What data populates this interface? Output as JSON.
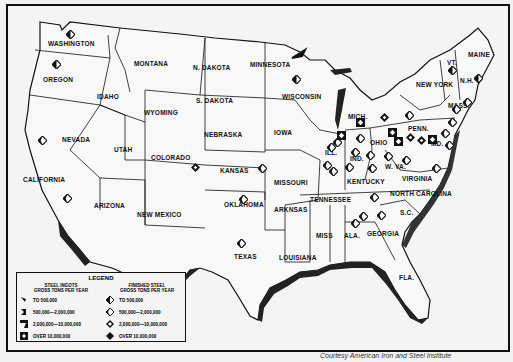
{
  "map": {
    "type": "US steel production map",
    "states": [
      {
        "name": "WASHINGTON",
        "x": 68,
        "y": 44
      },
      {
        "name": "OREGON",
        "x": 55,
        "y": 80
      },
      {
        "name": "MONTANA",
        "x": 148,
        "y": 64
      },
      {
        "name": "IDAHO",
        "x": 107,
        "y": 97
      },
      {
        "name": "WYOMING",
        "x": 158,
        "y": 113
      },
      {
        "name": "N. DAKOTA",
        "x": 211,
        "y": 68
      },
      {
        "name": "S. DAKOTA",
        "x": 214,
        "y": 101
      },
      {
        "name": "MINNESOTA",
        "x": 268,
        "y": 65
      },
      {
        "name": "WISCONSIN",
        "x": 300,
        "y": 97
      },
      {
        "name": "MICH.",
        "x": 358,
        "y": 117
      },
      {
        "name": "NEW YORK",
        "x": 432,
        "y": 85
      },
      {
        "name": "VT.",
        "x": 453,
        "y": 63
      },
      {
        "name": "N.H.",
        "x": 468,
        "y": 81
      },
      {
        "name": "MAINE",
        "x": 478,
        "y": 55
      },
      {
        "name": "MASS.",
        "x": 458,
        "y": 106
      },
      {
        "name": "PENN.",
        "x": 418,
        "y": 129
      },
      {
        "name": "MD.",
        "x": 437,
        "y": 144
      },
      {
        "name": "NEVADA",
        "x": 74,
        "y": 140
      },
      {
        "name": "UTAH",
        "x": 122,
        "y": 150
      },
      {
        "name": "COLORADO",
        "x": 167,
        "y": 158
      },
      {
        "name": "NEBRASKA",
        "x": 220,
        "y": 135
      },
      {
        "name": "IOWA",
        "x": 282,
        "y": 133
      },
      {
        "name": "ILL.",
        "x": 333,
        "y": 153
      },
      {
        "name": "IND.",
        "x": 358,
        "y": 159
      },
      {
        "name": "OHIO",
        "x": 378,
        "y": 143
      },
      {
        "name": "W. VA.",
        "x": 397,
        "y": 167
      },
      {
        "name": "CALIFORNIA",
        "x": 43,
        "y": 180
      },
      {
        "name": "KANSAS",
        "x": 232,
        "y": 171
      },
      {
        "name": "MISSOURI",
        "x": 290,
        "y": 183
      },
      {
        "name": "KENTUCKY",
        "x": 363,
        "y": 182
      },
      {
        "name": "VIRGINIA",
        "x": 418,
        "y": 179
      },
      {
        "name": "NORTH CAROLINA",
        "x": 418,
        "y": 194
      },
      {
        "name": "ARIZONA",
        "x": 108,
        "y": 206
      },
      {
        "name": "NEW MEXICO",
        "x": 157,
        "y": 215
      },
      {
        "name": "OKLAHOMA",
        "x": 240,
        "y": 205
      },
      {
        "name": "ARKNSAS",
        "x": 288,
        "y": 210
      },
      {
        "name": "TENNESSEE",
        "x": 328,
        "y": 200
      },
      {
        "name": "S.C.",
        "x": 408,
        "y": 213
      },
      {
        "name": "TEXAS",
        "x": 244,
        "y": 257
      },
      {
        "name": "LOUISIANA",
        "x": 297,
        "y": 258
      },
      {
        "name": "MISS",
        "x": 324,
        "y": 236
      },
      {
        "name": "ALA.",
        "x": 352,
        "y": 236
      },
      {
        "name": "GEORGIA",
        "x": 381,
        "y": 234
      },
      {
        "name": "FLA.",
        "x": 407,
        "y": 278
      }
    ],
    "symbols": [
      {
        "x": 70,
        "y": 34,
        "kind": "finished",
        "size": 1
      },
      {
        "x": 56,
        "y": 64,
        "kind": "finished",
        "size": 1
      },
      {
        "x": 42,
        "y": 140,
        "kind": "finished",
        "size": 2
      },
      {
        "x": 67,
        "y": 198,
        "kind": "finished",
        "size": 2
      },
      {
        "x": 195,
        "y": 167,
        "kind": "finished",
        "size": 3
      },
      {
        "x": 262,
        "y": 168,
        "kind": "finished",
        "size": 2
      },
      {
        "x": 241,
        "y": 243,
        "kind": "finished",
        "size": 2
      },
      {
        "x": 243,
        "y": 199,
        "kind": "finished",
        "size": 2
      },
      {
        "x": 296,
        "y": 79,
        "kind": "finished",
        "size": 1
      },
      {
        "x": 331,
        "y": 147,
        "kind": "finished",
        "size": 2
      },
      {
        "x": 337,
        "y": 142,
        "kind": "finished",
        "size": 2
      },
      {
        "x": 333,
        "y": 171,
        "kind": "finished",
        "size": 2
      },
      {
        "x": 327,
        "y": 165,
        "kind": "finished",
        "size": 2
      },
      {
        "x": 360,
        "y": 138,
        "kind": "finished",
        "size": 2
      },
      {
        "x": 355,
        "y": 152,
        "kind": "finished",
        "size": 2
      },
      {
        "x": 349,
        "y": 167,
        "kind": "finished",
        "size": 2
      },
      {
        "x": 370,
        "y": 155,
        "kind": "finished",
        "size": 2
      },
      {
        "x": 372,
        "y": 168,
        "kind": "finished",
        "size": 2
      },
      {
        "x": 388,
        "y": 156,
        "kind": "finished",
        "size": 2
      },
      {
        "x": 406,
        "y": 160,
        "kind": "finished",
        "size": 2
      },
      {
        "x": 409,
        "y": 115,
        "kind": "finished",
        "size": 2
      },
      {
        "x": 384,
        "y": 117,
        "kind": "finished",
        "size": 3
      },
      {
        "x": 392,
        "y": 132,
        "kind": "ingot",
        "size": 3
      },
      {
        "x": 398,
        "y": 141,
        "kind": "ingot",
        "size": 3
      },
      {
        "x": 410,
        "y": 137,
        "kind": "finished",
        "size": 3
      },
      {
        "x": 421,
        "y": 140,
        "kind": "finished",
        "size": 3
      },
      {
        "x": 432,
        "y": 139,
        "kind": "ingot",
        "size": 3
      },
      {
        "x": 445,
        "y": 133,
        "kind": "finished",
        "size": 2
      },
      {
        "x": 449,
        "y": 145,
        "kind": "finished",
        "size": 2
      },
      {
        "x": 452,
        "y": 122,
        "kind": "finished",
        "size": 2
      },
      {
        "x": 436,
        "y": 168,
        "kind": "finished",
        "size": 2
      },
      {
        "x": 452,
        "y": 70,
        "kind": "finished",
        "size": 1
      },
      {
        "x": 478,
        "y": 78,
        "kind": "finished",
        "size": 1
      },
      {
        "x": 467,
        "y": 102,
        "kind": "finished",
        "size": 2
      },
      {
        "x": 456,
        "y": 109,
        "kind": "finished",
        "size": 2
      },
      {
        "x": 374,
        "y": 197,
        "kind": "finished",
        "size": 2
      },
      {
        "x": 363,
        "y": 216,
        "kind": "finished",
        "size": 2
      },
      {
        "x": 355,
        "y": 223,
        "kind": "finished",
        "size": 2
      },
      {
        "x": 381,
        "y": 215,
        "kind": "finished",
        "size": 2
      },
      {
        "x": 360,
        "y": 122,
        "kind": "ingot",
        "size": 3
      },
      {
        "x": 341,
        "y": 135,
        "kind": "ingot",
        "size": 4
      }
    ]
  },
  "legend": {
    "title": "LEGEND",
    "ingots": {
      "heading_1": "STEEL INGOTS",
      "heading_2": "GROSS TONS PER YEAR",
      "items": [
        "TO 500,000",
        "500,000—2,000,000",
        "2,000,000—10,000,000",
        "OVER 10,000,000"
      ]
    },
    "finished": {
      "heading_1": "FINISHED STEEL",
      "heading_2": "GROSS TONS PER YEAR",
      "items": [
        "TO 500,000",
        "500,000—2,000,000",
        "2,000,000—10,000,000",
        "OVER 10,000,000"
      ]
    }
  },
  "credit": "Courtesy American Iron and Steel Institute"
}
